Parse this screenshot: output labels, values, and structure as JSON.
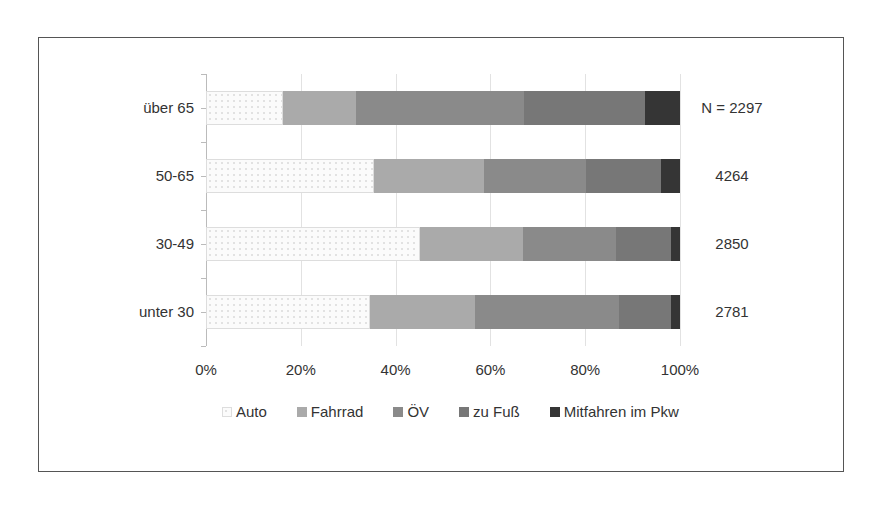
{
  "chart_data": {
    "type": "bar",
    "orientation": "horizontal",
    "stacked": "percent",
    "title": "",
    "xlabel": "",
    "ylabel": "",
    "categories": [
      "über 65",
      "50-65",
      "30-49",
      "unter 30"
    ],
    "series": [
      {
        "name": "Auto",
        "color": "#f7f7f7",
        "values": [
          16.2,
          35.4,
          45.1,
          34.6
        ]
      },
      {
        "name": "Fahrrad",
        "color": "#aaaaaa",
        "values": [
          15.4,
          23.2,
          21.8,
          22.2
        ]
      },
      {
        "name": "ÖV",
        "color": "#8a8a8a",
        "values": [
          35.5,
          21.6,
          19.6,
          30.3
        ]
      },
      {
        "name": "zu Fuß",
        "color": "#777777",
        "values": [
          25.5,
          15.8,
          11.6,
          11.0
        ]
      },
      {
        "name": "Mitfahren im Pkw",
        "color": "#353535",
        "values": [
          7.4,
          4.0,
          1.9,
          1.9
        ]
      }
    ],
    "sample_sizes": [
      "N = 2297",
      "4264",
      "2850",
      "2781"
    ],
    "x_ticks": [
      "0%",
      "20%",
      "40%",
      "60%",
      "80%",
      "100%"
    ],
    "xlim": [
      0,
      100
    ],
    "grid": true,
    "legend_position": "bottom"
  }
}
